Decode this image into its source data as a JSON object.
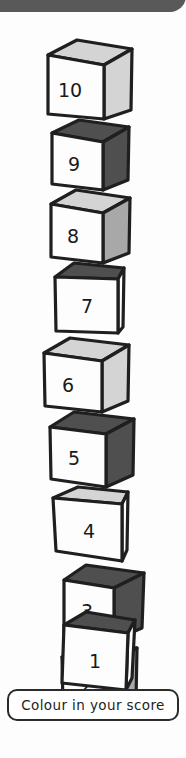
{
  "page": {
    "background_color": "#fdfdfd"
  },
  "top_banner": {
    "name": "top-banner",
    "color": "#595959"
  },
  "caption": {
    "text": "Colour in your score",
    "border_color": "#2b2b2b",
    "background_color": "#ffffff"
  },
  "palette": {
    "outline": "#1f1f1f",
    "face_white": "#fdfdfd",
    "face_light": "#d4d4d4",
    "face_medium": "#a8a8a8",
    "face_dark": "#4f4f4f"
  },
  "tower": {
    "count": 10,
    "cubes": [
      {
        "number": "10",
        "front": "#fdfdfd",
        "top": "#d4d4d4",
        "side": "#d4d4d4"
      },
      {
        "number": "9",
        "front": "#fdfdfd",
        "top": "#4f4f4f",
        "side": "#4f4f4f"
      },
      {
        "number": "8",
        "front": "#fdfdfd",
        "top": "#d4d4d4",
        "side": "#a8a8a8"
      },
      {
        "number": "7",
        "front": "#fdfdfd",
        "top": "#4f4f4f",
        "side": "#fdfdfd"
      },
      {
        "number": "6",
        "front": "#fdfdfd",
        "top": "#d4d4d4",
        "side": "#d4d4d4"
      },
      {
        "number": "5",
        "front": "#fdfdfd",
        "top": "#4f4f4f",
        "side": "#4f4f4f"
      },
      {
        "number": "4",
        "front": "#fdfdfd",
        "top": "#d4d4d4",
        "side": "#fdfdfd"
      },
      {
        "number": "3",
        "front": "#fdfdfd",
        "top": "#4f4f4f",
        "side": "#4f4f4f"
      },
      {
        "number": "2",
        "front": "#fdfdfd",
        "top": "#a8a8a8",
        "side": "#a8a8a8"
      },
      {
        "number": "1",
        "front": "#fdfdfd",
        "top": "#4f4f4f",
        "side": "#fdfdfd"
      }
    ]
  }
}
